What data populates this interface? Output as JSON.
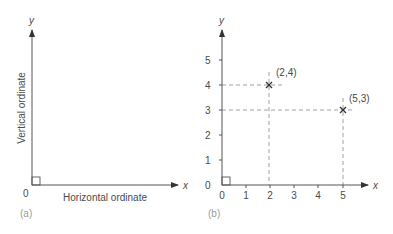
{
  "panels": [
    {
      "caption": "(a)",
      "x_axis_symbol": "x",
      "y_axis_symbol": "y",
      "origin_label": "0",
      "x_axis_title": "Horizontal ordinate",
      "y_axis_title": "Vertical ordinate"
    },
    {
      "caption": "(b)",
      "x_axis_symbol": "x",
      "y_axis_symbol": "y",
      "x_ticks": [
        "0",
        "1",
        "2",
        "3",
        "4",
        "5"
      ],
      "y_ticks": [
        "0",
        "1",
        "2",
        "3",
        "4",
        "5"
      ],
      "points": [
        {
          "label": "(2,4)",
          "x": 2,
          "y": 4
        },
        {
          "label": "(5,3)",
          "x": 5,
          "y": 3
        }
      ]
    }
  ],
  "colors": {
    "axis": "#555555",
    "dashed_guides": "#8a8a8a",
    "text": "#4a4a4a",
    "caption": "#9a9a9a"
  }
}
